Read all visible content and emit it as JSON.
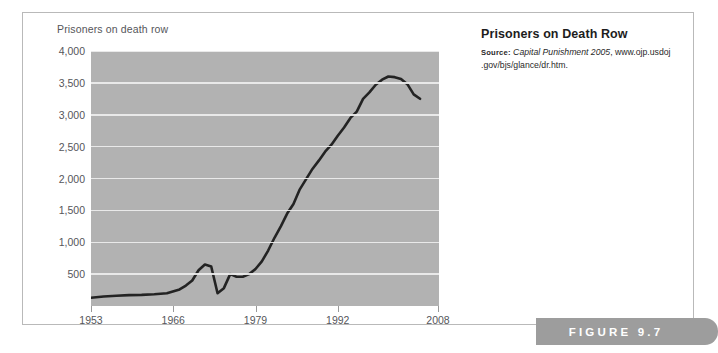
{
  "figure": {
    "ribbon_label": "FIGURE 9.7",
    "ribbon_color": "#9d9d9d",
    "frame_border_color": "#b9b9b9"
  },
  "caption": {
    "title": "Prisoners on Death Row",
    "source_word": "Source:",
    "source_publication": "Capital Punishment 2005",
    "source_rest": ", www.ojp.usdoj .gov/bjs/glance/dr.htm."
  },
  "chart_data": {
    "type": "line",
    "title": "Prisoners on Death Row",
    "axis_title": "Prisoners on death row",
    "xlabel": "",
    "ylabel": "Prisoners on death row",
    "xlim": [
      1953,
      2008
    ],
    "ylim": [
      0,
      4000
    ],
    "grid": true,
    "legend": "none",
    "plot_background": "#b2b2b2",
    "gridline_color": "#eeeeee",
    "line_color": "#232323",
    "line_width": 2.6,
    "ytick_labels": [
      "4,000",
      "3,500",
      "3,000",
      "2,500",
      "2,000",
      "1,500",
      "1,000",
      "500"
    ],
    "ytick_values": [
      4000,
      3500,
      3000,
      2500,
      2000,
      1500,
      1000,
      500
    ],
    "xtick_labels": [
      "1953",
      "1966",
      "1979",
      "1992",
      "2008"
    ],
    "xtick_values": [
      1953,
      1966,
      1979,
      1992,
      2008
    ],
    "series": [
      {
        "name": "Prisoners on death row",
        "x": [
          1953,
          1955,
          1957,
          1959,
          1961,
          1963,
          1965,
          1967,
          1968,
          1969,
          1970,
          1971,
          1972,
          1973,
          1974,
          1975,
          1976,
          1977,
          1978,
          1979,
          1980,
          1981,
          1982,
          1983,
          1984,
          1985,
          1986,
          1987,
          1988,
          1989,
          1990,
          1991,
          1992,
          1993,
          1994,
          1995,
          1996,
          1997,
          1998,
          1999,
          2000,
          2001,
          2002,
          2003,
          2004,
          2005
        ],
        "y": [
          130,
          150,
          160,
          170,
          175,
          185,
          200,
          260,
          320,
          400,
          560,
          650,
          620,
          200,
          280,
          500,
          460,
          460,
          500,
          580,
          700,
          870,
          1070,
          1250,
          1450,
          1600,
          1830,
          1990,
          2150,
          2280,
          2420,
          2530,
          2670,
          2800,
          2950,
          3050,
          3250,
          3350,
          3470,
          3550,
          3600,
          3590,
          3560,
          3480,
          3320,
          3250
        ],
        "units": "prisoners"
      }
    ],
    "annotations": [
      {
        "label": "1972 Furman decision drop",
        "x": 1973,
        "y": 200
      },
      {
        "label": "peak",
        "x": 2000,
        "y": 3600
      }
    ]
  }
}
